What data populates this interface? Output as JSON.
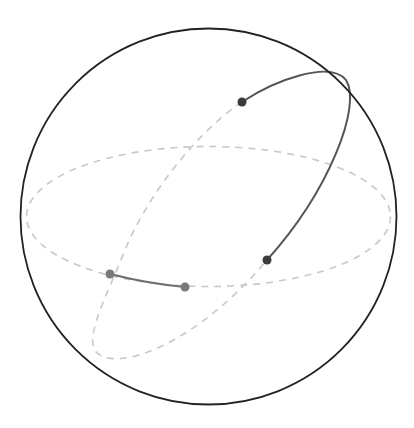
{
  "diagram": {
    "type": "sphere-great-circles",
    "colors": {
      "background": "#ffffff",
      "sphere_outline": "#222222",
      "hidden_dashed": "#c8c8c8",
      "front_arc": "#555555",
      "front_points": "#3c3c3c",
      "back_arc": "#6e6e6e",
      "back_points": "#7a7a7a"
    },
    "sphere": {
      "cx": 208.5,
      "cy": 216.5,
      "r": 188
    },
    "equator": {
      "cx": 208.5,
      "cy": 216.5,
      "rx": 182,
      "ry": 70
    },
    "points": [
      {
        "name": "point-front-top",
        "x": 242,
        "y": 102,
        "color": "#3c3c3c"
      },
      {
        "name": "point-front-right",
        "x": 267,
        "y": 260,
        "color": "#3c3c3c"
      },
      {
        "name": "point-back-left",
        "x": 110,
        "y": 274,
        "color": "#7a7a7a"
      },
      {
        "name": "point-back-middle",
        "x": 185,
        "y": 287,
        "color": "#7a7a7a"
      }
    ]
  }
}
